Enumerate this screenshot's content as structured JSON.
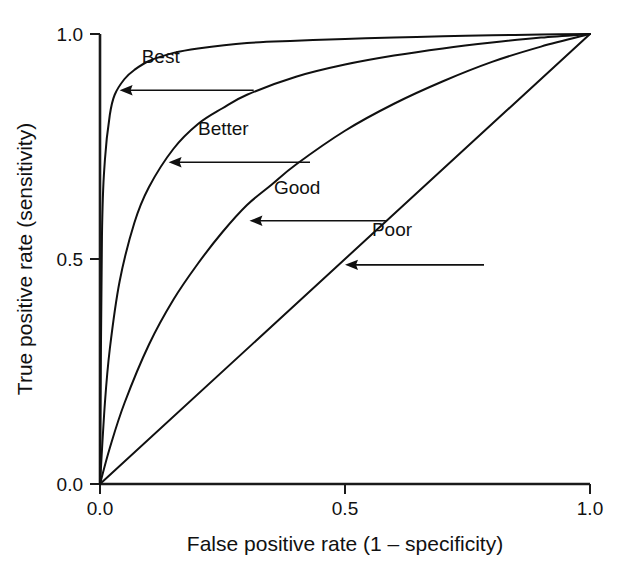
{
  "figure": {
    "background": "#ffffff",
    "ink_color": "#101010"
  },
  "chart_data": {
    "type": "line",
    "title": "",
    "subtitle": "",
    "xlabel": "False positive rate (1 – specificity)",
    "ylabel": "True positive rate (sensitivity)",
    "xlim": [
      0.0,
      1.0
    ],
    "ylim": [
      0.0,
      1.0
    ],
    "xticks": [
      0.0,
      0.5,
      1.0
    ],
    "yticks": [
      0.0,
      0.5,
      1.0
    ],
    "xticklabels": [
      "0.0",
      "0.5",
      "1.0"
    ],
    "yticklabels": [
      "0.0",
      "0.5",
      "1.0"
    ],
    "grid": false,
    "legend": "none (curves labelled inline with arrow annotations)",
    "series": [
      {
        "name": "Best",
        "x": [
          0.0,
          0.004,
          0.01,
          0.02,
          0.03,
          0.05,
          0.07,
          0.1,
          0.15,
          0.2,
          0.3,
          0.4,
          0.5,
          0.6,
          0.7,
          0.8,
          0.9,
          1.0
        ],
        "y": [
          0.0,
          0.55,
          0.72,
          0.82,
          0.865,
          0.9,
          0.92,
          0.94,
          0.958,
          0.968,
          0.98,
          0.985,
          0.989,
          0.992,
          0.995,
          0.997,
          0.999,
          1.0
        ]
      },
      {
        "name": "Better",
        "x": [
          0.0,
          0.01,
          0.02,
          0.04,
          0.07,
          0.1,
          0.15,
          0.2,
          0.25,
          0.3,
          0.4,
          0.5,
          0.6,
          0.7,
          0.8,
          0.9,
          1.0
        ],
        "y": [
          0.0,
          0.18,
          0.3,
          0.45,
          0.58,
          0.66,
          0.745,
          0.8,
          0.835,
          0.865,
          0.905,
          0.932,
          0.952,
          0.968,
          0.981,
          0.992,
          1.0
        ]
      },
      {
        "name": "Good",
        "x": [
          0.0,
          0.02,
          0.05,
          0.1,
          0.15,
          0.2,
          0.25,
          0.3,
          0.35,
          0.4,
          0.5,
          0.6,
          0.7,
          0.8,
          0.9,
          1.0
        ],
        "y": [
          0.0,
          0.08,
          0.18,
          0.31,
          0.41,
          0.49,
          0.56,
          0.62,
          0.665,
          0.71,
          0.785,
          0.845,
          0.895,
          0.938,
          0.972,
          1.0
        ]
      },
      {
        "name": "Poor",
        "x": [
          0.0,
          0.25,
          0.5,
          0.75,
          1.0
        ],
        "y": [
          0.0,
          0.25,
          0.5,
          0.75,
          1.0
        ]
      }
    ],
    "annotations": [
      {
        "label": "Best",
        "point": [
          0.04,
          0.875
        ],
        "text_pos": [
          0.085,
          0.935
        ]
      },
      {
        "label": "Better",
        "point": [
          0.14,
          0.715
        ],
        "text_pos": [
          0.2,
          0.775
        ]
      },
      {
        "label": "Good",
        "point": [
          0.305,
          0.585
        ],
        "text_pos": [
          0.355,
          0.645
        ]
      },
      {
        "label": "Poor",
        "point": [
          0.5,
          0.487
        ],
        "text_pos": [
          0.555,
          0.552
        ]
      }
    ]
  }
}
